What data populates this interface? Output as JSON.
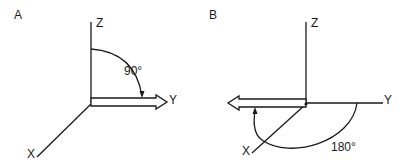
{
  "panels": [
    {
      "label": "A",
      "axes": {
        "z": "Z",
        "y": "Y",
        "x": "X"
      },
      "rotation": {
        "angle_label": "90°",
        "from_axis": "Z",
        "to_axis": "Y",
        "degrees": 90
      },
      "vector_direction": "+Y"
    },
    {
      "label": "B",
      "axes": {
        "z": "Z",
        "y": "Y",
        "x": "X"
      },
      "rotation": {
        "angle_label": "180°",
        "from_axis": "Y",
        "to_axis": "-Y",
        "degrees": 180
      },
      "vector_direction": "-Y"
    }
  ]
}
